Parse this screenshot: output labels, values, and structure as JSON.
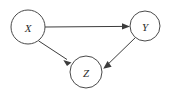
{
  "figure": {
    "type": "directed-acyclic-graph",
    "width": 174,
    "height": 94,
    "background_color": "#ffffff",
    "stroke_color": "#3c3c3c",
    "node_stroke_color": "#4a4a4a",
    "node_fill_color": "#ffffff",
    "label_color": "#2b2b2b"
  },
  "nodes": [
    {
      "id": "X",
      "label": "X",
      "cx": 28,
      "cy": 27,
      "r": 17
    },
    {
      "id": "Y",
      "label": "Y",
      "cx": 145,
      "cy": 26,
      "r": 15
    },
    {
      "id": "Z",
      "label": "Z",
      "cx": 86,
      "cy": 72,
      "r": 16
    }
  ],
  "edges": [
    {
      "id": "x-to-y",
      "from": "X",
      "to": "Y",
      "label": "",
      "arrow": "to"
    },
    {
      "id": "x-to-z",
      "from": "X",
      "to": "Z",
      "label": "",
      "arrow": "to"
    },
    {
      "id": "y-to-z",
      "from": "Y",
      "to": "Z",
      "label": "",
      "arrow": "to"
    }
  ]
}
